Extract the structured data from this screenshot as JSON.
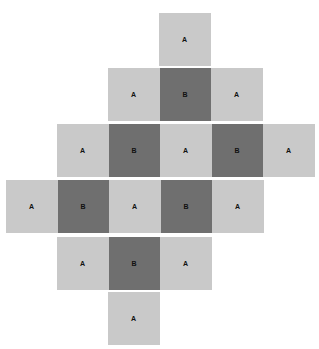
{
  "figure": {
    "title": "",
    "background": "#ffffff",
    "colors": {
      "light": "#c9c9c9",
      "dark": "#6f6f6f",
      "label_text": "#111111"
    },
    "cell_size": {
      "width": 51.5,
      "height": 53
    },
    "labels": {
      "light": "A",
      "dark": "B"
    },
    "rows": [
      {
        "index": 0,
        "top": 13,
        "left": 159,
        "cells": [
          {
            "label": "A",
            "type": "light"
          }
        ]
      },
      {
        "index": 1,
        "top": 68,
        "left": 108,
        "cells": [
          {
            "label": "A",
            "type": "light"
          },
          {
            "label": "B",
            "type": "dark"
          },
          {
            "label": "A",
            "type": "light"
          }
        ]
      },
      {
        "index": 2,
        "top": 124,
        "left": 57,
        "cells": [
          {
            "label": "A",
            "type": "light"
          },
          {
            "label": "B",
            "type": "dark"
          },
          {
            "label": "A",
            "type": "light"
          },
          {
            "label": "B",
            "type": "dark"
          },
          {
            "label": "A",
            "type": "light"
          }
        ]
      },
      {
        "index": 3,
        "top": 180,
        "left": 6,
        "cells": [
          {
            "label": "A",
            "type": "light"
          },
          {
            "label": "B",
            "type": "dark"
          },
          {
            "label": "A",
            "type": "light"
          },
          {
            "label": "B",
            "type": "dark"
          },
          {
            "label": "A",
            "type": "light"
          }
        ]
      },
      {
        "index": 4,
        "top": 237,
        "left": 57,
        "cells": [
          {
            "label": "A",
            "type": "light"
          },
          {
            "label": "B",
            "type": "dark"
          },
          {
            "label": "A",
            "type": "light"
          }
        ]
      },
      {
        "index": 5,
        "top": 292,
        "left": 108,
        "cells": [
          {
            "label": "A",
            "type": "light"
          }
        ]
      }
    ]
  }
}
